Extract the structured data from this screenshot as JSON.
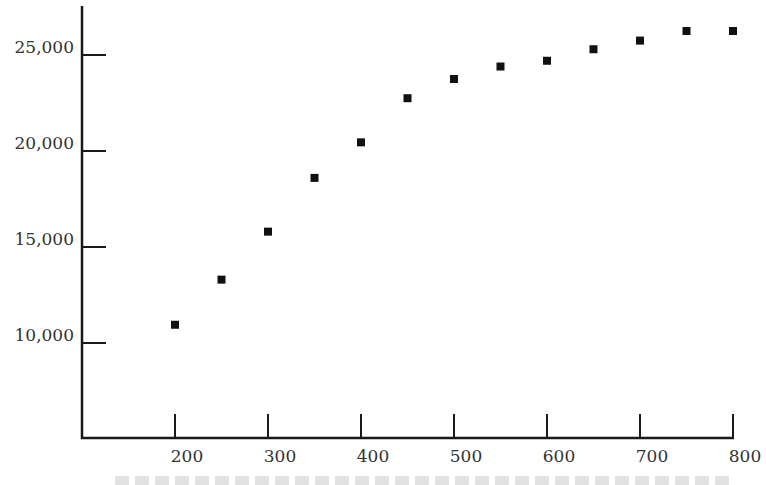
{
  "chart_data": {
    "type": "scatter",
    "title": "",
    "xlabel": "",
    "ylabel": "",
    "x_ticks": [
      200,
      300,
      400,
      500,
      600,
      700,
      800
    ],
    "x_tick_labels": [
      "200",
      "300",
      "400",
      "500",
      "600",
      "700",
      "800"
    ],
    "y_ticks": [
      10000,
      15000,
      20000,
      25000
    ],
    "y_tick_labels": [
      "10,000",
      "15,000",
      "20,000",
      "25,000"
    ],
    "xlim": [
      100,
      800
    ],
    "ylim": [
      5000,
      27000
    ],
    "grid": false,
    "legend": null,
    "marker": "square",
    "marker_color": "#111111",
    "series": [
      {
        "name": "data",
        "x": [
          200,
          250,
          300,
          350,
          400,
          450,
          500,
          550,
          600,
          650,
          700,
          750,
          800
        ],
        "y": [
          10950,
          13300,
          15800,
          18600,
          20450,
          22750,
          23750,
          24400,
          24700,
          25300,
          25750,
          26250,
          26250
        ]
      }
    ]
  },
  "caption": {
    "visible_text": ""
  },
  "colors": {
    "axis": "#1a1a1a",
    "label": "#333333",
    "marker": "#111111"
  }
}
